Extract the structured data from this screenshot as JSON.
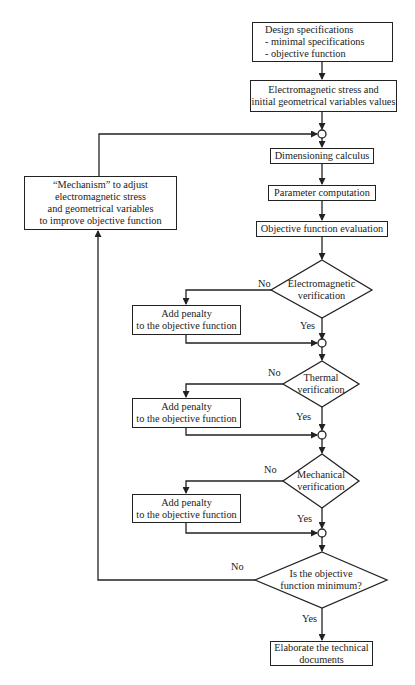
{
  "diagram": {
    "type": "flowchart",
    "nodes": {
      "design_spec": {
        "line1": "Design specifications",
        "line2": "- minimal specifications",
        "line3": "- objective function"
      },
      "em_stress_init": {
        "line1": "Electromagnetic stress and",
        "line2": "initial geometrical variables values"
      },
      "dimensioning": {
        "label": "Dimensioning calculus"
      },
      "parameter_comp": {
        "label": "Parameter computation"
      },
      "objective_eval": {
        "label": "Objective function evaluation"
      },
      "mechanism": {
        "line1": "“Mechanism” to adjust",
        "line2": "electromagnetic stress",
        "line3": "and geometrical variables",
        "line4": "to improve objective function"
      },
      "em_verification": {
        "line1": "Electromagnetic",
        "line2": "verification"
      },
      "thermal_verification": {
        "line1": "Thermal",
        "line2": "verification"
      },
      "mechanical_verification": {
        "line1": "Mechanical",
        "line2": "verification"
      },
      "objective_min": {
        "line1": "Is the objective",
        "line2": "function minimum?"
      },
      "penalty_1": {
        "line1": "Add penalty",
        "line2": "to the objective function"
      },
      "penalty_2": {
        "line1": "Add penalty",
        "line2": "to the objective function"
      },
      "penalty_3": {
        "line1": "Add penalty",
        "line2": "to the objective function"
      },
      "technical_docs": {
        "line1": "Elaborate the technical",
        "line2": "documents"
      }
    },
    "edge_labels": {
      "em_no": "No",
      "em_yes": "Yes",
      "thermal_no": "No",
      "thermal_yes": "Yes",
      "mech_no": "No",
      "mech_yes": "Yes",
      "min_no": "No",
      "min_yes": "Yes"
    },
    "colors": {
      "line": "#222222",
      "background": "#ffffff"
    }
  }
}
